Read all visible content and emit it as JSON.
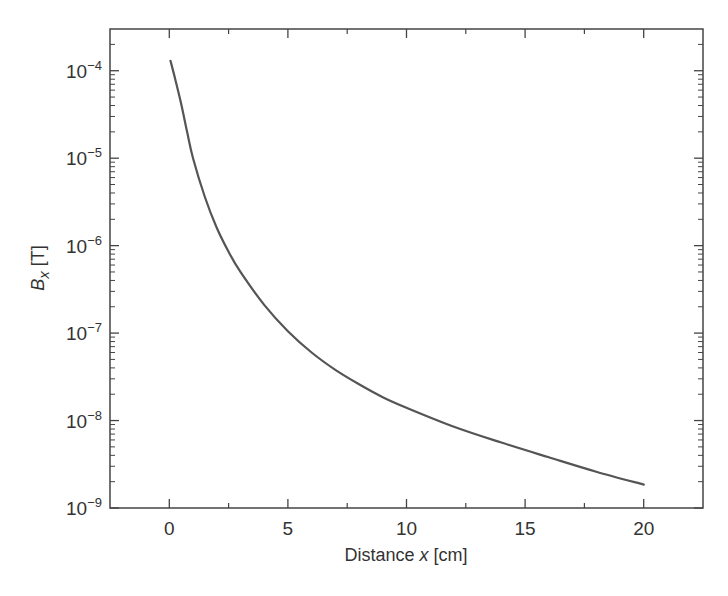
{
  "chart_data": {
    "type": "line",
    "title": "",
    "xlabel": "Distance x [cm]",
    "xlabel_parts": {
      "pre": "Distance ",
      "var": "x",
      "post": " [cm]"
    },
    "ylabel": "B_x [T]",
    "ylabel_parts": {
      "base": "B",
      "sub": "x",
      "post": " [T]"
    },
    "xlim": [
      -2.5,
      22.5
    ],
    "ylim": [
      1e-09,
      0.0003
    ],
    "yscale": "log",
    "grid": false,
    "legend": null,
    "x_ticks": [
      0,
      5,
      10,
      15,
      20
    ],
    "x_tick_labels": [
      "0",
      "5",
      "10",
      "15",
      "20"
    ],
    "y_ticks": [
      1e-09,
      1e-08,
      1e-07,
      1e-06,
      1e-05,
      0.0001
    ],
    "y_tick_labels": [
      {
        "base": "10",
        "exp": "−9"
      },
      {
        "base": "10",
        "exp": "−8"
      },
      {
        "base": "10",
        "exp": "−7"
      },
      {
        "base": "10",
        "exp": "−6"
      },
      {
        "base": "10",
        "exp": "−5"
      },
      {
        "base": "10",
        "exp": "−4"
      }
    ],
    "series": [
      {
        "name": "B_x",
        "color": "#555555",
        "x": [
          0.05,
          0.25,
          0.5,
          0.75,
          1.0,
          1.5,
          2.0,
          2.5,
          3.0,
          4.0,
          5.0,
          6.0,
          7.0,
          8.0,
          9.0,
          10.0,
          12.0,
          14.0,
          16.0,
          18.0,
          20.0
        ],
        "y": [
          0.00013,
          8e-05,
          4.2e-05,
          2e-05,
          1e-05,
          3.6e-06,
          1.6e-06,
          8.5e-07,
          5e-07,
          2.1e-07,
          1.05e-07,
          6e-08,
          3.8e-08,
          2.6e-08,
          1.85e-08,
          1.4e-08,
          8.5e-09,
          5.6e-09,
          3.8e-09,
          2.6e-09,
          1.85e-09
        ]
      }
    ]
  }
}
